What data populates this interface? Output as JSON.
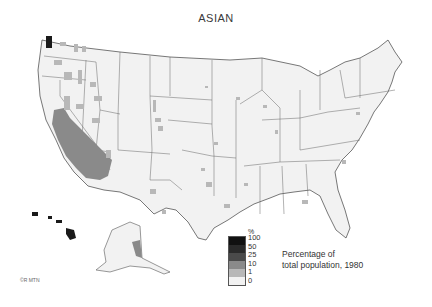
{
  "title": "ASIAN",
  "legend": {
    "unit": "%",
    "classes": [
      {
        "label": "100",
        "color": "#111111"
      },
      {
        "label": "50",
        "color": "#2a2a2a"
      },
      {
        "label": "25",
        "color": "#4a4a4a"
      },
      {
        "label": "10",
        "color": "#8a8a8a"
      },
      {
        "label": "1",
        "color": "#b8b8b8"
      },
      {
        "label": "0",
        "color": "#f2f2f2"
      }
    ],
    "caption_line1": "Percentage of",
    "caption_line2": "total population, 1980"
  },
  "credit": "©R MTN",
  "colors": {
    "land": "#f2f2f2",
    "border": "#555555",
    "low": "#b8b8b8",
    "mid": "#8a8a8a",
    "high": "#1a1a1a"
  }
}
